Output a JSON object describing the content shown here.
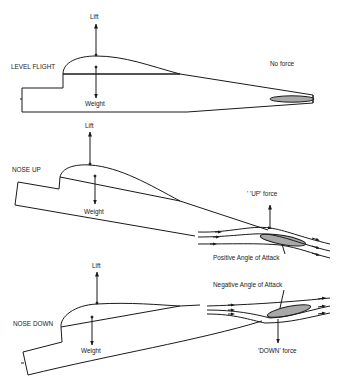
{
  "panels": [
    {
      "title": "LEVEL FLIGHT",
      "lift_label": "Lift",
      "weight_label": "Weight",
      "tail_label": "No force"
    },
    {
      "title": "NOSE UP",
      "lift_label": "Lift",
      "weight_label": "Weight",
      "tail_label": "' 'UP' force",
      "angle_label": "Positive Angle of Attack"
    },
    {
      "title": "NOSE DOWN",
      "lift_label": "Lift",
      "weight_label": "Weight",
      "tail_label": "'DOWN' force",
      "angle_label": "Negative Angle of Attack"
    }
  ],
  "colors": {
    "line": "#1a1a1a",
    "tailplane_fill": "#a8a8a8",
    "background": "#ffffff"
  }
}
